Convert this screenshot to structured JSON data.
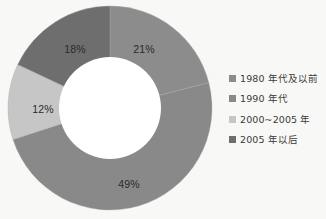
{
  "chart_data": {
    "type": "pie",
    "variant": "donut",
    "title": "",
    "subtitle": "",
    "xlabel": "",
    "ylabel": "",
    "grid": false,
    "legend_position": "right",
    "start_angle_deg": 0,
    "direction": "clockwise",
    "inner_radius_ratio": 0.5,
    "categories": [
      "1980 年代及以前",
      "1990 年代",
      "2000~2005 年",
      "2005 年以后"
    ],
    "values": [
      21,
      49,
      12,
      18
    ],
    "value_labels": [
      "21%",
      "49%",
      "12%",
      "18%"
    ],
    "colors": [
      "#8c8c8c",
      "#898989",
      "#c6c6c6",
      "#6e6e6e"
    ],
    "units": "percent",
    "total": 100
  },
  "slices": [
    {
      "label": "21%",
      "category": "1980 年代及以前",
      "value": 21,
      "color": "#8c8c8c"
    },
    {
      "label": "49%",
      "category": "1990 年代",
      "value": 49,
      "color": "#898989"
    },
    {
      "label": "12%",
      "category": "2000~2005 年",
      "value": 12,
      "color": "#c6c6c6"
    },
    {
      "label": "18%",
      "category": "2005 年以后",
      "value": 18,
      "color": "#6e6e6e"
    }
  ],
  "legend": {
    "items": [
      {
        "label": "1980 年代及以前",
        "color": "#8c8c8c"
      },
      {
        "label": "1990 年代",
        "color": "#898989"
      },
      {
        "label": "2000~2005 年",
        "color": "#c6c6c6"
      },
      {
        "label": "2005 年以后",
        "color": "#6e6e6e"
      }
    ]
  },
  "style": {
    "background": "#f8f8f6",
    "hole_color": "#ffffff",
    "label_color": "#2a2a2a",
    "legend_text_color": "#3a3a3a"
  }
}
